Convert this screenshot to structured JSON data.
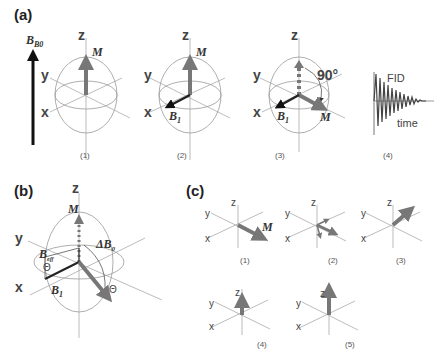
{
  "panels": {
    "a": {
      "label": "(a)",
      "b0_label": "B0",
      "steps": [
        {
          "caption": "(1)",
          "axes": {
            "z": "z",
            "y": "y",
            "x": "x"
          },
          "vector_label": "M"
        },
        {
          "caption": "(2)",
          "axes": {
            "z": "z",
            "y": "y",
            "x": "x"
          },
          "vector_label": "M",
          "field_label": "B1"
        },
        {
          "caption": "(3)",
          "axes": {
            "z": "z",
            "y": "y",
            "x": "x"
          },
          "vector_label": "M",
          "field_label": "B1",
          "angle_label": "90°"
        },
        {
          "caption": "(4)",
          "signal_label": "FID",
          "time_label": "time"
        }
      ]
    },
    "b": {
      "label": "(b)",
      "axes": {
        "z": "z",
        "y": "y",
        "x": "x"
      },
      "labels": {
        "m": "M",
        "delta_b0": "ΔB0",
        "b_eff": "Beff",
        "b1": "B1",
        "theta1": "Θ",
        "theta2": "Θ"
      }
    },
    "c": {
      "label": "(c)",
      "steps": [
        {
          "caption": "(1)",
          "axes": {
            "z": "z",
            "y": "y",
            "x": "x"
          },
          "vector_label": "M"
        },
        {
          "caption": "(2)",
          "axes": {
            "z": "z",
            "y": "y",
            "x": "x"
          }
        },
        {
          "caption": "(3)",
          "axes": {
            "z": "z",
            "y": "y",
            "x": "x"
          }
        },
        {
          "caption": "(4)",
          "axes": {
            "z": "z",
            "y": "y",
            "x": "x"
          }
        },
        {
          "caption": "(5)",
          "axes": {
            "z": "z",
            "y": "y",
            "x": "x"
          }
        }
      ]
    }
  },
  "colors": {
    "magnetization": "#777777",
    "field": "#222222",
    "axis": "#aaaaaa",
    "sphere": "#999999"
  }
}
